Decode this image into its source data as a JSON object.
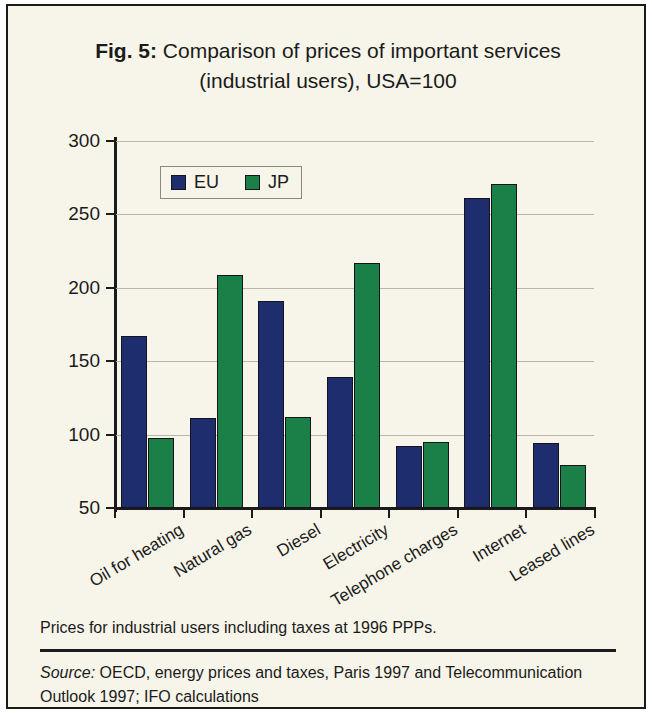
{
  "figure": {
    "label": "Fig. 5:",
    "title_rest": " Comparison of prices of important services (industrial users), USA=100",
    "note": "Prices for industrial users including taxes at 1996 PPPs.",
    "source_label": "Source:",
    "source_rest": " OECD, energy prices and taxes, Paris 1997 and Telecommunication Outlook 1997; IFO calculations"
  },
  "colors": {
    "eu": "#1e2d6e",
    "jp": "#1a8048",
    "background": "#f7f5e9",
    "frame": "#1a1a1a",
    "gridline": "#b9b7a6"
  },
  "legend": {
    "position": "top-left-inside",
    "entries": [
      {
        "name": "EU",
        "color": "#1e2d6e"
      },
      {
        "name": "JP",
        "color": "#1a8048"
      }
    ]
  },
  "chart_data": {
    "type": "bar",
    "title": "Fig. 5: Comparison of prices of important services (industrial users), USA=100",
    "xlabel": "",
    "ylabel": "",
    "ylim": [
      50,
      300
    ],
    "yticks": [
      50,
      100,
      150,
      200,
      250,
      300
    ],
    "grid": true,
    "legend_position": "top-left",
    "categories": [
      "Oil for heating",
      "Natural gas",
      "Diesel",
      "Electricity",
      "Telephone charges",
      "Internet",
      "Leased lines"
    ],
    "series": [
      {
        "name": "EU",
        "color": "#1e2d6e",
        "values": [
          167,
          111,
          191,
          139,
          92,
          261,
          94
        ]
      },
      {
        "name": "JP",
        "color": "#1a8048",
        "values": [
          98,
          209,
          112,
          217,
          95,
          271,
          79
        ]
      }
    ]
  }
}
